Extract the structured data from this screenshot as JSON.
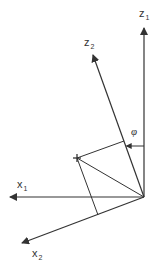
{
  "diagram": {
    "title": "",
    "colors": {
      "line": "#333333",
      "background": "#ffffff"
    },
    "origin": {
      "x": 144,
      "y": 197
    },
    "axes": [
      {
        "id": "z1",
        "letter": "z",
        "subscript": "1",
        "tip": {
          "x": 144,
          "y": 28
        },
        "label_pos": {
          "x": 139,
          "y": 17
        }
      },
      {
        "id": "z2",
        "letter": "z",
        "subscript": "2",
        "tip": {
          "x": 93,
          "y": 55
        },
        "label_pos": {
          "x": 84,
          "y": 46
        }
      },
      {
        "id": "x1",
        "letter": "x",
        "subscript": "1",
        "tip": {
          "x": 10,
          "y": 197
        },
        "label_pos": {
          "x": 17,
          "y": 188
        }
      },
      {
        "id": "x2",
        "letter": "x",
        "subscript": "2",
        "tip": {
          "x": 22,
          "y": 243
        },
        "label_pos": {
          "x": 32,
          "y": 257
        }
      }
    ],
    "point": {
      "symbol": "+",
      "x": 77,
      "y": 158
    },
    "projections": {
      "on_z2": {
        "x": 124,
        "y": 141
      },
      "on_x2": {
        "x": 98,
        "y": 215
      }
    },
    "angle": {
      "symbol": "φ",
      "label_pos": {
        "x": 131,
        "y": 135
      },
      "from": "z1",
      "to": "z2",
      "arrow_y": 146
    }
  }
}
